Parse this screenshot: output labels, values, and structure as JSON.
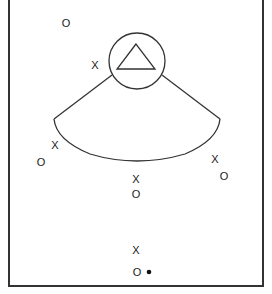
{
  "diagram": {
    "type": "play-diagram",
    "colors": {
      "line": "#333333",
      "background": "#ffffff"
    },
    "defender_zone": {
      "circle": {
        "cx": 137,
        "cy": 61,
        "r": 28
      },
      "triangle_label": "triangle",
      "fan_arc": true
    },
    "players": [
      {
        "symbol": "O",
        "x": 66,
        "y": 23
      },
      {
        "symbol": "X",
        "x": 95,
        "y": 65
      },
      {
        "symbol": "X",
        "x": 55,
        "y": 145
      },
      {
        "symbol": "O",
        "x": 41,
        "y": 162
      },
      {
        "symbol": "X",
        "x": 215,
        "y": 159
      },
      {
        "symbol": "O",
        "x": 224,
        "y": 176
      },
      {
        "symbol": "X",
        "x": 136,
        "y": 179
      },
      {
        "symbol": "O",
        "x": 136,
        "y": 194
      },
      {
        "symbol": "X",
        "x": 136,
        "y": 250
      },
      {
        "symbol": "O",
        "x": 137,
        "y": 272
      }
    ],
    "ball": {
      "x": 149,
      "y": 272
    }
  }
}
